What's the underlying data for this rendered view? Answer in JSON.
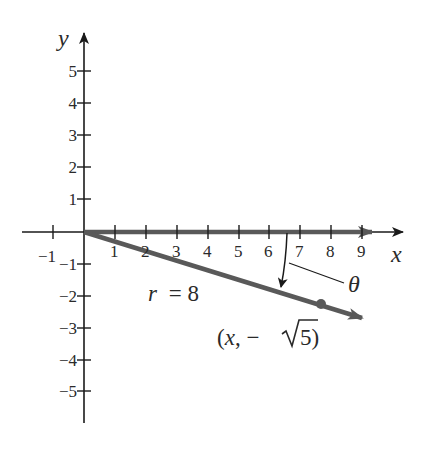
{
  "figure": {
    "x_axis_label": "x",
    "y_axis_label": "y",
    "x_ticks": [
      "−1",
      "1",
      "2",
      "3",
      "4",
      "5",
      "6",
      "7",
      "8",
      "9"
    ],
    "y_ticks_pos": [
      "5",
      "4",
      "3",
      "2",
      "1"
    ],
    "y_ticks_neg": [
      "−1",
      "−2",
      "−3",
      "−4",
      "−5"
    ],
    "radius_label_var": "r",
    "radius_label_eq": "= 8",
    "angle_label": "θ",
    "point_label_open": "(",
    "point_label_x": "x",
    "point_label_mid": ", −",
    "point_label_radicand": "5",
    "point_label_close": ")",
    "colors": {
      "axis": "#1a1a1a",
      "ray": "#595959",
      "text": "#2a2a2a"
    }
  }
}
